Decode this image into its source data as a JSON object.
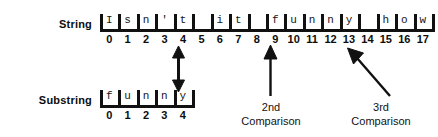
{
  "diagram": {
    "title_hidden": "String matching comparison diagram",
    "rows": [
      {
        "name": "string-row",
        "label": "String",
        "cells": [
          {
            "index": "0",
            "char": "I"
          },
          {
            "index": "1",
            "char": "s"
          },
          {
            "index": "2",
            "char": "n"
          },
          {
            "index": "3",
            "char": "'"
          },
          {
            "index": "4",
            "char": "t"
          },
          {
            "index": "5",
            "char": " "
          },
          {
            "index": "6",
            "char": "i"
          },
          {
            "index": "7",
            "char": "t"
          },
          {
            "index": "8",
            "char": " "
          },
          {
            "index": "9",
            "char": "f"
          },
          {
            "index": "10",
            "char": "u"
          },
          {
            "index": "11",
            "char": "n"
          },
          {
            "index": "12",
            "char": "n"
          },
          {
            "index": "13",
            "char": "y"
          },
          {
            "index": "14",
            "char": " "
          },
          {
            "index": "15",
            "char": "h"
          },
          {
            "index": "16",
            "char": "o"
          },
          {
            "index": "17",
            "char": "w"
          }
        ]
      },
      {
        "name": "substring-row",
        "label": "Substring",
        "cells": [
          {
            "index": "0",
            "char": "f"
          },
          {
            "index": "1",
            "char": "u"
          },
          {
            "index": "2",
            "char": "n"
          },
          {
            "index": "3",
            "char": "n"
          },
          {
            "index": "4",
            "char": "y"
          }
        ]
      }
    ],
    "annotations": [
      {
        "name": "second-comparison-label",
        "text": "2nd\nComparison"
      },
      {
        "name": "third-comparison-label",
        "text": "3rd\nComparison"
      }
    ],
    "colors": {
      "ink": "#111111",
      "background": "#ffffff"
    }
  }
}
